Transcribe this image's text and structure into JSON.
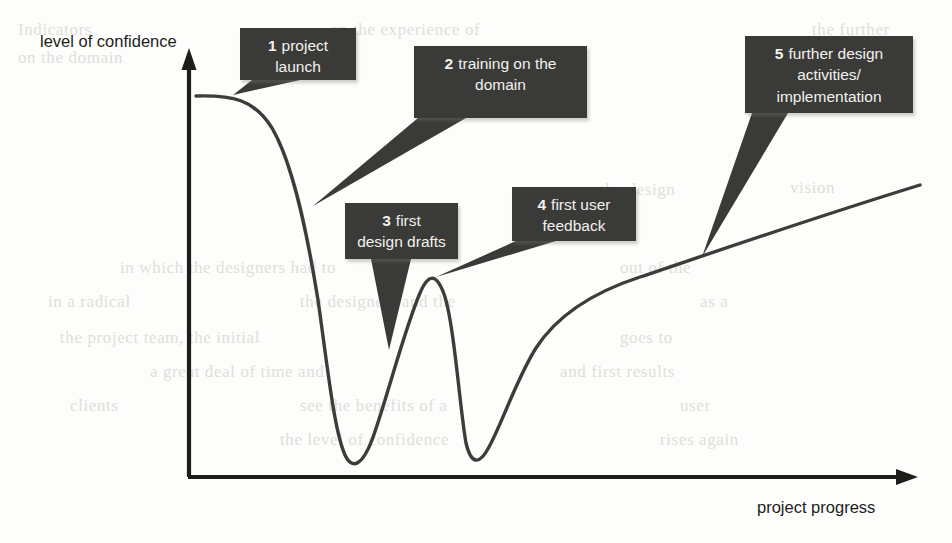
{
  "figure": {
    "y_axis_label": "level of confidence",
    "x_axis_label": "project progress"
  },
  "callouts": [
    {
      "number": "1",
      "line1": "project",
      "line2": "launch",
      "line3": ""
    },
    {
      "number": "2",
      "line1": "training on the",
      "line2": "domain",
      "line3": ""
    },
    {
      "number": "3",
      "line1": "first",
      "line2": "design drafts",
      "line3": ""
    },
    {
      "number": "4",
      "line1": "first user",
      "line2": "feedback",
      "line3": ""
    },
    {
      "number": "5",
      "line1": "further design",
      "line2": "activities/",
      "line3": "implementation"
    }
  ],
  "colors": {
    "callout_background": "#3a3a38",
    "callout_text": "#f2f1ee",
    "curve": "#3c3c3a",
    "axis": "#1d1d1b",
    "page_background": "#fdfdfc"
  },
  "chart_data": {
    "type": "line",
    "title": "",
    "xlabel": "project progress",
    "ylabel": "level of confidence",
    "grid": false,
    "legend": "none",
    "axis_style": "arrow-headed, no tick marks, no numeric scale",
    "xlim": [
      0,
      100
    ],
    "ylim": [
      0,
      100
    ],
    "series": [
      {
        "name": "level of confidence over project progress",
        "x": [
          1,
          6,
          10,
          13,
          16,
          19,
          22,
          25,
          28,
          31,
          34,
          37,
          40,
          43,
          46,
          49,
          52,
          55,
          58,
          62,
          67,
          72,
          78,
          84,
          90,
          96,
          100
        ],
        "y": [
          89,
          89,
          88,
          84,
          76,
          62,
          45,
          28,
          14,
          6,
          5,
          10,
          24,
          41,
          52,
          53,
          44,
          26,
          11,
          5,
          14,
          32,
          42,
          51,
          58,
          66,
          76
        ]
      }
    ],
    "annotations": [
      {
        "number": "1",
        "label": "project launch",
        "x": 7,
        "y": 88
      },
      {
        "number": "2",
        "label": "training on the domain",
        "x": 20,
        "y": 58
      },
      {
        "number": "3",
        "label": "first design drafts",
        "x": 38,
        "y": 31
      },
      {
        "number": "4",
        "label": "first user feedback",
        "x": 46,
        "y": 53
      },
      {
        "number": "5",
        "label": "further design activities/ implementation",
        "x": 75,
        "y": 57
      }
    ]
  },
  "bleed_text": {
    "items": [
      {
        "text": "the further",
        "x": 812,
        "y": 20
      },
      {
        "text": "Indicators",
        "x": 18,
        "y": 20
      },
      {
        "text": "on the experience of",
        "x": 330,
        "y": 20
      },
      {
        "text": "on the domain",
        "x": 18,
        "y": 48
      },
      {
        "text": "the design",
        "x": 600,
        "y": 180
      },
      {
        "text": "vision",
        "x": 790,
        "y": 178
      },
      {
        "text": "in which the designers had to",
        "x": 120,
        "y": 258
      },
      {
        "text": "out of the",
        "x": 620,
        "y": 258
      },
      {
        "text": "in a radical",
        "x": 48,
        "y": 292
      },
      {
        "text": "the designers and the",
        "x": 300,
        "y": 292
      },
      {
        "text": "as a",
        "x": 700,
        "y": 292
      },
      {
        "text": "the project team, the initial",
        "x": 60,
        "y": 328
      },
      {
        "text": "goes to",
        "x": 620,
        "y": 328
      },
      {
        "text": "a great deal of time and",
        "x": 150,
        "y": 362
      },
      {
        "text": "and first results",
        "x": 560,
        "y": 362
      },
      {
        "text": "clients",
        "x": 70,
        "y": 396
      },
      {
        "text": "see the benefits of a",
        "x": 300,
        "y": 396
      },
      {
        "text": "user",
        "x": 680,
        "y": 396
      },
      {
        "text": "the level of confidence",
        "x": 280,
        "y": 430
      },
      {
        "text": "rises again",
        "x": 660,
        "y": 430
      }
    ]
  }
}
